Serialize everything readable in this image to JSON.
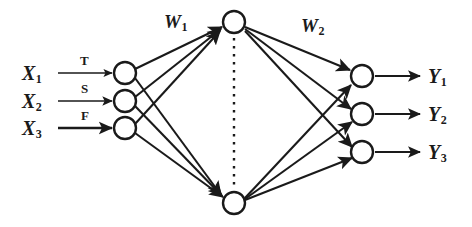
{
  "figure": {
    "type": "neural-network-diagram",
    "background_color": "#ffffff",
    "ink_color": "#1a1a1a"
  },
  "input_layer": {
    "nodes": [
      {
        "id": "x1",
        "label": "X",
        "subscript": "1",
        "edge_label": "T",
        "cx": 125,
        "cy": 73
      },
      {
        "id": "x2",
        "label": "X",
        "subscript": "2",
        "edge_label": "S",
        "cx": 125,
        "cy": 101
      },
      {
        "id": "x3",
        "label": "X",
        "subscript": "3",
        "edge_label": "F",
        "cx": 125,
        "cy": 128
      }
    ],
    "node_radius": 11
  },
  "hidden_layer": {
    "nodes": [
      {
        "id": "h1",
        "cx": 234,
        "cy": 22
      },
      {
        "id": "hn",
        "cx": 234,
        "cy": 203
      }
    ],
    "node_radius": 11,
    "ellipsis": {
      "style": "vertical-dotted-line",
      "x": 234,
      "y_top": 38,
      "y_bottom": 190
    }
  },
  "output_layer": {
    "nodes": [
      {
        "id": "y1",
        "label": "Y",
        "subscript": "1",
        "cx": 362,
        "cy": 76
      },
      {
        "id": "y2",
        "label": "Y",
        "subscript": "2",
        "cx": 362,
        "cy": 114
      },
      {
        "id": "y3",
        "label": "Y",
        "subscript": "3",
        "cx": 362,
        "cy": 152
      }
    ],
    "node_radius": 11
  },
  "weights": [
    {
      "id": "w1",
      "label": "W",
      "subscript": "1",
      "x": 164,
      "y": 22
    },
    {
      "id": "w2",
      "label": "W",
      "subscript": "2",
      "x": 308,
      "y": 26
    }
  ]
}
